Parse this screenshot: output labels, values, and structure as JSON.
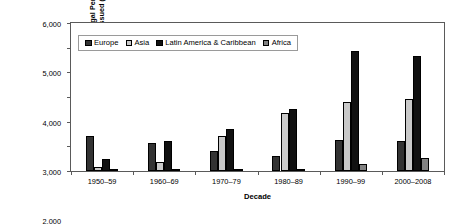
{
  "chart_data": {
    "type": "bar",
    "title": "",
    "xlabel": "Decade",
    "ylabel_lines": [
      "Number of Legal Permanenet",
      "Resident Visas Issued (Thousands)"
    ],
    "ylabel": "Number of Legal Permanenet Resident Visas Issued (Thousands)",
    "categories": [
      "1950–59",
      "1960–69",
      "1970–79",
      "1980–89",
      "1990–99",
      "2000–2008"
    ],
    "series": [
      {
        "name": "Europe",
        "color": "#333333",
        "values": [
          1400,
          1120,
          800,
          620,
          1250,
          1200
        ]
      },
      {
        "name": "Asia",
        "color": "#c9c9c9",
        "values": [
          150,
          350,
          1400,
          2350,
          2800,
          2900
        ]
      },
      {
        "name": "Latin America & Caribbean",
        "color": "#111111",
        "values": [
          500,
          1200,
          1700,
          2500,
          4850,
          4650
        ]
      },
      {
        "name": "Africa",
        "color": "#828282",
        "values": [
          15,
          30,
          80,
          90,
          270,
          530
        ]
      }
    ],
    "ylim": [
      0,
      6000
    ],
    "yticks": [
      0,
      1000,
      2000,
      3000,
      4000,
      5000,
      6000
    ],
    "ytick_labels": [
      "0",
      "1,000",
      "2,000",
      "3,000",
      "4,000",
      "5,000",
      "6,000"
    ],
    "grid": false,
    "legend_position": "upper-left-inside"
  },
  "legend": {
    "items": [
      {
        "label": "Europe",
        "color": "#333333"
      },
      {
        "label": "Asia",
        "color": "#c9c9c9"
      },
      {
        "label": "Latin America & Caribbean",
        "color": "#111111"
      },
      {
        "label": "Africa",
        "color": "#828282"
      }
    ]
  },
  "axes": {
    "x_title": "Decade",
    "y_title_line1": "Number of Legal Permanenet",
    "y_title_line2": "Resident Visas Issued (Thousands)"
  }
}
